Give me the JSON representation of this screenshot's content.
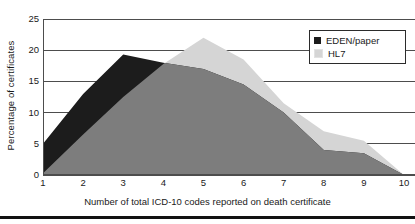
{
  "chart_data": {
    "type": "area",
    "title": "",
    "subtitle": "",
    "xlabel": "Number of total ICD-10 codes reported on death certificate",
    "ylabel": "Percentage of certificates",
    "x": [
      1,
      2,
      3,
      4,
      5,
      6,
      7,
      8,
      9,
      10
    ],
    "categories": [
      "1",
      "2",
      "3",
      "4",
      "5",
      "6",
      "7",
      "8",
      "9",
      "10"
    ],
    "xlim": [
      1,
      10
    ],
    "ylim": [
      0,
      25
    ],
    "y_ticks": [
      0,
      5,
      10,
      15,
      20,
      25
    ],
    "y_tick_labels": [
      "0",
      "5",
      "10",
      "15",
      "20",
      "25"
    ],
    "x_ticks": [
      1,
      2,
      3,
      4,
      5,
      6,
      7,
      8,
      9,
      10
    ],
    "x_tick_labels": [
      "1",
      "2",
      "3",
      "4",
      "5",
      "6",
      "7",
      "8",
      "9",
      "10"
    ],
    "grid": "horizontal",
    "legend_position": "top-right",
    "series": [
      {
        "name": "EDEN/paper",
        "color": "#1c1c1c",
        "values": [
          5.0,
          13.0,
          19.3,
          18.0,
          17.0,
          14.5,
          10.0,
          4.0,
          3.5,
          0.0
        ]
      },
      {
        "name": "HL7",
        "color": "#d5d5d5",
        "values": [
          0.3,
          6.5,
          12.5,
          17.8,
          22.0,
          18.5,
          11.5,
          7.0,
          5.5,
          0.0
        ]
      }
    ],
    "overlap_color": "#7d7d7d",
    "grid_color": "#4d4d4d",
    "axis_color": "#4d4d4d"
  },
  "legend": {
    "items": [
      {
        "label": "EDEN/paper",
        "color": "#1c1c1c"
      },
      {
        "label": "HL7",
        "color": "#d5d5d5"
      }
    ]
  },
  "axes": {
    "y_title": "Percentage of certificates",
    "x_title": "Number of total ICD-10 codes reported on death certificate"
  }
}
